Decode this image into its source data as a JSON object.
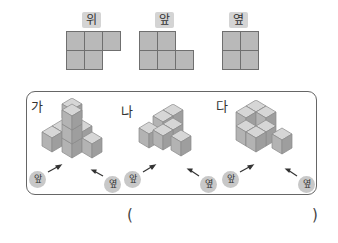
{
  "views": [
    {
      "label": "위",
      "cells": [
        [
          1,
          1,
          1
        ],
        [
          1,
          1,
          0
        ]
      ]
    },
    {
      "label": "앞",
      "cells": [
        [
          1,
          1,
          0
        ],
        [
          1,
          1,
          1
        ]
      ]
    },
    {
      "label": "옆",
      "cells": [
        [
          1,
          1
        ],
        [
          1,
          1
        ]
      ]
    }
  ],
  "options": [
    {
      "label": "가",
      "front_label": "앞",
      "side_label": "옆"
    },
    {
      "label": "나",
      "front_label": "앞",
      "side_label": "옆"
    },
    {
      "label": "다",
      "front_label": "앞",
      "side_label": "옆"
    }
  ],
  "answer": {
    "open": "(",
    "close": ")",
    "value": ""
  },
  "colors": {
    "cell_fill": "#b9b9b9",
    "cell_stroke": "#7a7a7a",
    "label_bg": "#d4d4d4",
    "box_border": "#666666"
  }
}
